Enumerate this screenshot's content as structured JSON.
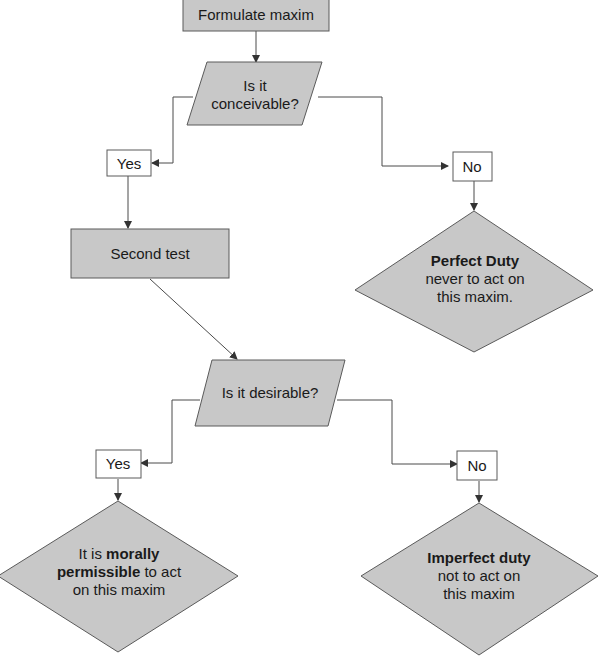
{
  "diagram": {
    "type": "flowchart",
    "colors": {
      "shape_fill": "#c8c8c8",
      "stroke": "#5a5a5a",
      "label_fill": "#ffffff",
      "text": "#1a1a1a"
    },
    "nodes": {
      "start": {
        "text": "Formulate maxim"
      },
      "q1": {
        "line1": "Is it",
        "line2": "conceivable?"
      },
      "q1_yes": {
        "text": "Yes"
      },
      "q1_no": {
        "text": "No"
      },
      "second": {
        "text": "Second test"
      },
      "perfect": {
        "title": "Perfect Duty",
        "line1": "never to act on",
        "line2": "this maxim."
      },
      "q2": {
        "text": "Is it desirable?"
      },
      "q2_yes": {
        "text": "Yes"
      },
      "q2_no": {
        "text": "No"
      },
      "permissible": {
        "pre": "It is ",
        "bold1": "morally",
        "bold2": "permissible",
        "post": " to act",
        "line3": "on this maxim"
      },
      "imperfect": {
        "title": "Imperfect duty",
        "line1": "not to act on",
        "line2": "this maxim"
      }
    },
    "edges": [
      {
        "from": "start",
        "to": "q1"
      },
      {
        "from": "q1",
        "to": "q1_yes"
      },
      {
        "from": "q1",
        "to": "q1_no"
      },
      {
        "from": "q1_yes",
        "to": "second"
      },
      {
        "from": "q1_no",
        "to": "perfect"
      },
      {
        "from": "second",
        "to": "q2"
      },
      {
        "from": "q2",
        "to": "q2_yes"
      },
      {
        "from": "q2",
        "to": "q2_no"
      },
      {
        "from": "q2_yes",
        "to": "permissible"
      },
      {
        "from": "q2_no",
        "to": "imperfect"
      }
    ]
  }
}
